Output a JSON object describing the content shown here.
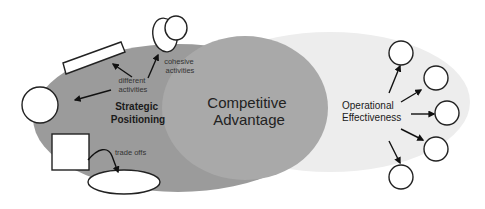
{
  "diagram": {
    "regions": {
      "strategic": {
        "label_line1": "Strategic",
        "label_line2": "Positioning",
        "color": "#9a9a9a"
      },
      "competitive": {
        "label_line1": "Competitive",
        "label_line2": "Advantage",
        "color": "#a8a8a8"
      },
      "operational": {
        "label_line1": "Operational",
        "label_line2": "Effectiveness",
        "color": "#ececec"
      }
    },
    "annotations": {
      "different_line1": "different",
      "different_line2": "activities",
      "cohesive_line1": "cohesive",
      "cohesive_line2": "activities",
      "trade_offs": "trade offs"
    }
  }
}
